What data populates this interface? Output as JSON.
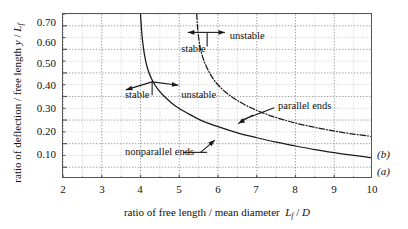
{
  "chart_data": {
    "type": "line",
    "title": "",
    "xlabel": "ratio of free length / mean diameter  L_f / D",
    "ylabel": "ratio of deflection / free length  y / L_f",
    "xlim": [
      2,
      10
    ],
    "ylim": [
      0.05,
      0.75
    ],
    "xticks": [
      2,
      3,
      4,
      5,
      6,
      7,
      8,
      9,
      10
    ],
    "yticks": [
      0.1,
      0.2,
      0.3,
      0.4,
      0.5,
      0.6,
      0.7
    ],
    "grid": true,
    "grid_minor": true,
    "legend": "none",
    "series": [
      {
        "name": "(a)",
        "label": "nonparallel ends",
        "style": "solid",
        "points": [
          [
            4.0,
            0.75
          ],
          [
            4.02,
            0.7
          ],
          [
            4.05,
            0.64
          ],
          [
            4.1,
            0.58
          ],
          [
            4.18,
            0.52
          ],
          [
            4.3,
            0.47
          ],
          [
            4.45,
            0.43
          ],
          [
            4.65,
            0.395
          ],
          [
            4.9,
            0.36
          ],
          [
            5.2,
            0.33
          ],
          [
            5.55,
            0.3
          ],
          [
            6.0,
            0.272
          ],
          [
            6.5,
            0.246
          ],
          [
            7.0,
            0.225
          ],
          [
            7.5,
            0.206
          ],
          [
            8.0,
            0.19
          ],
          [
            8.5,
            0.175
          ],
          [
            9.0,
            0.162
          ],
          [
            9.5,
            0.15
          ],
          [
            10.0,
            0.14
          ]
        ]
      },
      {
        "name": "(b)",
        "label": "parallel ends",
        "style": "dash-dot",
        "points": [
          [
            5.45,
            0.75
          ],
          [
            5.47,
            0.7
          ],
          [
            5.5,
            0.65
          ],
          [
            5.55,
            0.6
          ],
          [
            5.63,
            0.555
          ],
          [
            5.75,
            0.51
          ],
          [
            5.92,
            0.465
          ],
          [
            6.15,
            0.425
          ],
          [
            6.45,
            0.388
          ],
          [
            6.85,
            0.352
          ],
          [
            7.3,
            0.322
          ],
          [
            7.8,
            0.296
          ],
          [
            8.3,
            0.276
          ],
          [
            8.85,
            0.258
          ],
          [
            9.4,
            0.243
          ],
          [
            10.0,
            0.23
          ]
        ]
      }
    ],
    "annotations": [
      {
        "name": "stable-upper",
        "text": "stable",
        "x": 5.05,
        "y": 0.6
      },
      {
        "name": "unstable-upper",
        "text": "unstable",
        "x": 6.3,
        "y": 0.658
      },
      {
        "name": "stable-lower",
        "text": "stable",
        "x": 3.6,
        "y": 0.407
      },
      {
        "name": "unstable-lower",
        "text": "unstable",
        "x": 5.05,
        "y": 0.407
      },
      {
        "name": "parallel-ends",
        "text": "parallel ends",
        "x": 7.55,
        "y": 0.358
      },
      {
        "name": "nonparallel-ends",
        "text": "nonparallel ends",
        "x": 3.6,
        "y": 0.163
      }
    ],
    "curve_end_labels": [
      {
        "name": "(b)",
        "text": "(b)",
        "at_x": 10,
        "at_y": 0.23
      },
      {
        "name": "(a)",
        "text": "(a)",
        "at_x": 10,
        "at_y": 0.14
      }
    ]
  },
  "axes": {
    "y_title_main": "ratio of deflection / free length",
    "y_title_sym_y": "y",
    "y_title_slash": "/",
    "y_title_sym_L": "L",
    "y_title_sub_f": "f",
    "x_title_main": "ratio of free length / mean diameter",
    "x_title_sym_L": "L",
    "x_title_sub_f": "f",
    "x_title_slash": "/",
    "x_title_sym_D": "D",
    "ytick_labels": [
      "0.70",
      "0.60",
      "0.50",
      "0.40",
      "0.30",
      "0.20",
      "0.10"
    ],
    "xtick_labels": [
      "2",
      "3",
      "4",
      "5",
      "6",
      "7",
      "8",
      "9",
      "10"
    ]
  },
  "colors": {
    "axis": "#555555",
    "curve": "#1a1a1a",
    "grid_major": "#8a8a8a",
    "grid_minor": "#bdbdbd",
    "text": "#111111",
    "background": "#ffffff"
  }
}
